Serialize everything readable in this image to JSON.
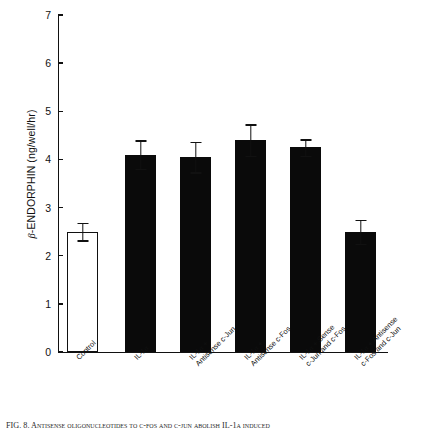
{
  "figure": {
    "caption": "FIG. 8. Antisense oligonucleotides to c-fos and c-jun abolish IL-1α induced",
    "caption_prefix": "FIG. 8."
  },
  "chart_data": {
    "type": "bar",
    "title": "",
    "xlabel": "",
    "ylabel": "β-ENDORPHIN (ng/well/hr)",
    "ylabel_symbol": "β",
    "ylabel_text": "-ENDORPHIN (ng/well/hr)",
    "ylim": [
      0,
      7
    ],
    "yticks": [
      0,
      1,
      2,
      3,
      4,
      5,
      6,
      7
    ],
    "ytick_labels": [
      "0",
      "1",
      "2",
      "3",
      "4",
      "5",
      "6",
      "7"
    ],
    "grid": false,
    "legend": false,
    "error_type": "SEM",
    "categories": [
      "Control",
      "IL-1α",
      "IL-1α +\nAntisense c-Jun",
      "IL-1α +\nAntisense c-Fos",
      "IL-1α + Sense\nc-Jun and c-Fos",
      "IL-1α + Antisense\nc-Fos and c-Jun"
    ],
    "category_lines": [
      [
        "Control"
      ],
      [
        "IL-1α"
      ],
      [
        "IL-1α +",
        "Antisense c-Jun"
      ],
      [
        "IL-1α +",
        "Antisense c-Fos"
      ],
      [
        "IL-1α + Sense",
        "c-Jun and c-Fos"
      ],
      [
        "IL-1α + Antisense",
        "c-Fos and c-Jun"
      ]
    ],
    "values": [
      2.5,
      4.1,
      4.05,
      4.4,
      4.25,
      2.5
    ],
    "errors": [
      0.18,
      0.3,
      0.32,
      0.33,
      0.17,
      0.25
    ],
    "fills": [
      "open",
      "filled",
      "filled",
      "filled",
      "filled",
      "filled"
    ],
    "bar_color": "#0a0a0a",
    "open_bar_color": "#ffffff",
    "axis_color": "#111111"
  }
}
